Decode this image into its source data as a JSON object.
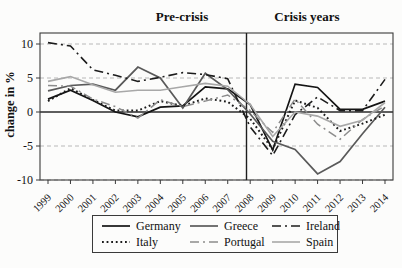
{
  "chart_data": {
    "type": "line",
    "title": "",
    "ylabel": "change in %",
    "xlabel": "",
    "x": [
      1999,
      2000,
      2001,
      2002,
      2003,
      2004,
      2005,
      2006,
      2007,
      2008,
      2009,
      2010,
      2011,
      2012,
      2013,
      2014
    ],
    "ylim": [
      -10,
      11.5
    ],
    "yticks": [
      10,
      5,
      0,
      -5,
      -10
    ],
    "grid": "dashed horizontal gridlines at 10, 5, -5, -10; solid black zero line; solid vertical divider at 2008",
    "divider_x": 2008,
    "annotations": [
      {
        "text": "Pre-crisis",
        "region": "1999-2007"
      },
      {
        "text": "Crisis years",
        "region": "2008-2014"
      }
    ],
    "legend_position": "bottom box, 2 rows x 3 columns",
    "series": [
      {
        "name": "Germany",
        "color": "#141414",
        "dash": "solid",
        "width": 1.7,
        "values": [
          1.9,
          3.2,
          1.7,
          0.0,
          -0.7,
          0.7,
          0.9,
          3.7,
          3.4,
          1.1,
          -5.6,
          4.1,
          3.6,
          0.4,
          0.4,
          1.6
        ]
      },
      {
        "name": "Greece",
        "color": "#5a5a5a",
        "dash": "solid",
        "width": 1.7,
        "values": [
          3.1,
          3.9,
          4.1,
          3.2,
          6.6,
          5.0,
          0.6,
          5.7,
          3.3,
          -0.3,
          -4.3,
          -5.5,
          -9.1,
          -7.3,
          -3.2,
          0.7
        ]
      },
      {
        "name": "Ireland",
        "color": "#1c1c1c",
        "dash": "dashdot",
        "width": 1.6,
        "values": [
          10.2,
          9.7,
          6.2,
          5.4,
          4.5,
          5.1,
          5.8,
          5.5,
          4.9,
          -2.2,
          -6.4,
          -0.4,
          2.2,
          0.2,
          0.2,
          4.8
        ]
      },
      {
        "name": "Italy",
        "color": "#1c1c1c",
        "dash": "dotted",
        "width": 2.0,
        "values": [
          1.6,
          3.5,
          1.8,
          0.2,
          0.2,
          1.6,
          0.9,
          2.0,
          1.5,
          -1.0,
          -5.5,
          1.7,
          0.6,
          -2.8,
          -1.7,
          -0.4
        ]
      },
      {
        "name": "Portugal",
        "color": "#8c8c8c",
        "dash": "dashdot",
        "width": 1.5,
        "values": [
          3.9,
          3.8,
          1.9,
          0.8,
          -0.9,
          1.8,
          0.8,
          1.6,
          2.5,
          0.2,
          -3.0,
          1.9,
          -1.8,
          -4.0,
          -1.1,
          0.9
        ]
      },
      {
        "name": "Spain",
        "color": "#a8a8a8",
        "dash": "solid",
        "width": 1.6,
        "values": [
          4.5,
          5.2,
          4.0,
          2.9,
          3.2,
          3.2,
          3.7,
          4.2,
          3.8,
          1.1,
          -3.6,
          0.0,
          -0.6,
          -2.1,
          -1.2,
          1.4
        ]
      }
    ]
  }
}
